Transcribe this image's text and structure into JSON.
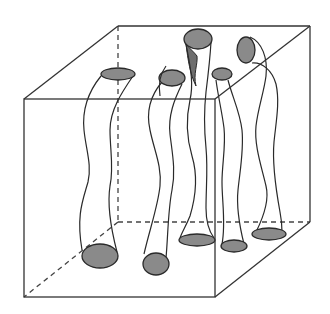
{
  "diagram": {
    "title": "",
    "colors": {
      "background": "#ffffff",
      "line": "#333333",
      "cap_fill": "#8a8a8a",
      "shade_fill": "#6e6e6e"
    },
    "cube": {
      "visible_edges": "solid",
      "hidden_edges": "dashed"
    },
    "tube_count": 8,
    "labels": []
  }
}
